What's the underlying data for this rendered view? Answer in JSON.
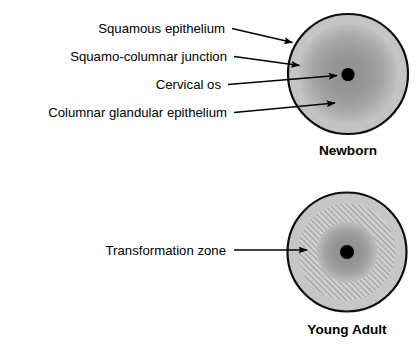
{
  "figure": {
    "title_visible": false,
    "background_color": "#ffffff",
    "panels": [
      {
        "id": "newborn",
        "caption": "Newborn",
        "caption_x": 348,
        "caption_y": 155,
        "center_x": 348,
        "center_y": 74,
        "outer_radius": 61,
        "rings": [
          {
            "name": "squamous-epithelium-ring",
            "radius": 61,
            "fill": "#c8c8c8",
            "stroke": "#000000",
            "stroke_width": 2
          },
          {
            "name": "columnar-glandular-epithelium-disc",
            "radius": 50,
            "fill": "#9a9a9a",
            "stroke": "none",
            "stroke_width": 0
          },
          {
            "name": "cervical-os-dot",
            "radius": 6.5,
            "fill": "#000000",
            "stroke": "none",
            "stroke_width": 0
          }
        ],
        "callouts": [
          {
            "label": "Squamous epithelium",
            "text_anchor_x": 226,
            "text_baseline_y": 33,
            "leader_start_x": 232,
            "leader_start_y": 29,
            "arrow_tip_x": 292,
            "arrow_tip_y": 42
          },
          {
            "label": "Squamo-columnar junction",
            "text_anchor_x": 228,
            "text_baseline_y": 61,
            "leader_start_x": 234,
            "leader_start_y": 57,
            "arrow_tip_x": 299,
            "arrow_tip_y": 65
          },
          {
            "label": "Cervical os",
            "text_anchor_x": 222,
            "text_baseline_y": 89,
            "leader_start_x": 228,
            "leader_start_y": 85,
            "arrow_tip_x": 336,
            "arrow_tip_y": 75
          },
          {
            "label": "Columnar glandular epithelium",
            "text_anchor_x": 228,
            "text_baseline_y": 117,
            "leader_start_x": 234,
            "leader_start_y": 113,
            "arrow_tip_x": 334,
            "arrow_tip_y": 104
          }
        ]
      },
      {
        "id": "young-adult",
        "caption": "Young Adult",
        "caption_x": 347,
        "caption_y": 334,
        "center_x": 347,
        "center_y": 252,
        "outer_radius": 60,
        "rings": [
          {
            "name": "squamous-epithelium-ring",
            "radius": 60,
            "fill": "#c8c8c8",
            "stroke": "#000000",
            "stroke_width": 2
          },
          {
            "name": "transformation-zone-hatched-ring",
            "radius": 49,
            "fill": "hatch",
            "stroke": "none",
            "stroke_width": 0
          },
          {
            "name": "columnar-glandular-epithelium-disc",
            "radius": 31,
            "fill": "#9a9a9a",
            "stroke": "none",
            "stroke_width": 0
          },
          {
            "name": "cervical-os-dot",
            "radius": 7,
            "fill": "#000000",
            "stroke": "none",
            "stroke_width": 0
          }
        ],
        "callouts": [
          {
            "label": "Transformation zone",
            "text_anchor_x": 226,
            "text_baseline_y": 255,
            "leader_start_x": 234,
            "leader_start_y": 250,
            "arrow_tip_x": 306,
            "arrow_tip_y": 250
          }
        ]
      }
    ],
    "colors": {
      "outline": "#000000",
      "outer_ring_gray": "#c8c8c8",
      "inner_disc_gray": "#9a9a9a",
      "inner_disc_edge_gray": "#bdbdbd",
      "os_black": "#000000",
      "hatch_line": "#8c8c8c",
      "hatch_bg": "#cfcfcf",
      "leader_line": "#000000"
    }
  }
}
